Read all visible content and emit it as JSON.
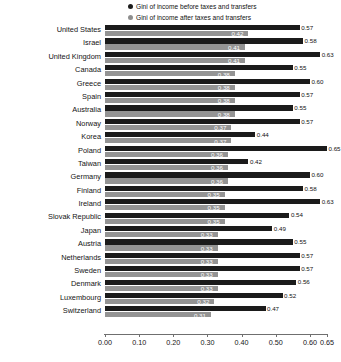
{
  "legend": {
    "items": [
      {
        "label": "Gini of income before taxes and transfers",
        "marker": "filled-circle-dark",
        "color": "#1c1c1c"
      },
      {
        "label": "Gini of income after taxes and transfers",
        "marker": "filled-circle-gray",
        "color": "#8e8e8e"
      }
    ]
  },
  "axis": {
    "ticks": [
      "0.00",
      "0.10",
      "0.20",
      "0.30",
      "0.40",
      "0.50",
      "0.60",
      "0.65"
    ],
    "tick_values": [
      0.0,
      0.1,
      0.2,
      0.3,
      0.4,
      0.5,
      0.6,
      0.65
    ]
  },
  "chart_data": {
    "type": "bar",
    "orientation": "horizontal",
    "title": "",
    "subtitle": "",
    "xlabel": "",
    "ylabel": "",
    "xlim": [
      0.0,
      0.65
    ],
    "grid": false,
    "legend_position": "top-right",
    "categories": [
      "United States",
      "Israel",
      "United Kingdom",
      "Canada",
      "Greece",
      "Spain",
      "Australia",
      "Norway",
      "Korea",
      "Poland",
      "Taiwan",
      "Germany",
      "Finland",
      "Ireland",
      "Slovak Republic",
      "Japan",
      "Austria",
      "Netherlands",
      "Sweden",
      "Denmark",
      "Luxembourg",
      "Switzerland"
    ],
    "series": [
      {
        "name": "Gini of income before taxes and transfers",
        "color": "#1b1b1b",
        "values": [
          0.57,
          0.58,
          0.63,
          0.55,
          0.6,
          0.57,
          0.55,
          0.57,
          0.44,
          0.65,
          0.42,
          0.6,
          0.58,
          0.63,
          0.54,
          0.49,
          0.55,
          0.57,
          0.57,
          0.56,
          0.52,
          0.47
        ],
        "labels": [
          "0.57",
          "0.58",
          "0.63",
          "0.55",
          "0.60",
          "0.57",
          "0.55",
          "0.57",
          "0.44",
          "0.65",
          "0.42",
          "0.60",
          "0.58",
          "0.63",
          "0.54",
          "0.49",
          "0.55",
          "0.57",
          "0.57",
          "0.56",
          "0.52",
          "0.47"
        ]
      },
      {
        "name": "Gini of income after taxes and transfers",
        "color": "#949494",
        "values": [
          0.42,
          0.41,
          0.41,
          0.38,
          0.38,
          0.38,
          0.38,
          0.37,
          0.37,
          0.36,
          0.36,
          0.36,
          0.35,
          0.35,
          0.35,
          0.33,
          0.33,
          0.33,
          0.33,
          0.33,
          0.32,
          0.31
        ],
        "labels": [
          "0.42",
          "0.41",
          "0.41",
          "0.38",
          "0.38",
          "0.38",
          "0.38",
          "0.37",
          "0.37",
          "0.36",
          "0.36",
          "0.36",
          "0.35",
          "0.35",
          "0.35",
          "0.33",
          "0.33",
          "0.33",
          "0.33",
          "0.33",
          "0.32",
          "0.31"
        ]
      }
    ]
  }
}
